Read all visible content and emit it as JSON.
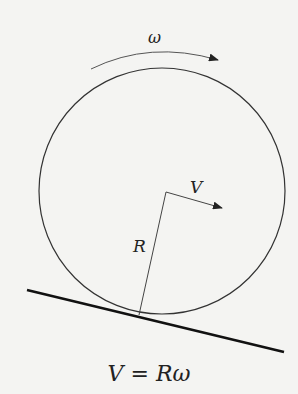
{
  "diagram": {
    "labels": {
      "angular_velocity": "ω",
      "velocity": "V",
      "radius": "R"
    },
    "equation": {
      "lhs": "V",
      "op": "=",
      "rhs_r": "R",
      "rhs_w": "ω"
    },
    "elements": [
      "circle-wheel",
      "inclined-surface-line",
      "radius-line",
      "velocity-arrow",
      "rotation-arc-arrow"
    ]
  }
}
